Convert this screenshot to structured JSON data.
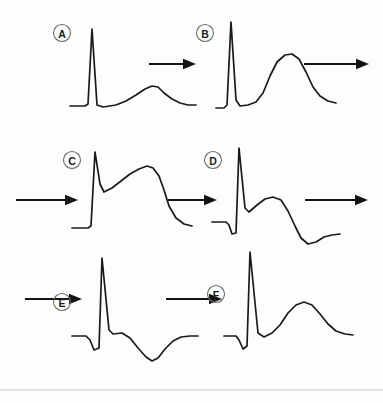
{
  "figure": {
    "background_color": "#fdfdfd",
    "stroke_color": "#1a1a1a",
    "label_circle_color": "#6b6b6b",
    "rule_color": "#c9c9c9"
  },
  "panels": [
    {
      "id": "A",
      "label": "A",
      "description": "Normal ECG complex: flat baseline, tall narrow R wave, low broad upright T wave",
      "label_pos": {
        "x": 62,
        "y": 33
      },
      "path": "M 70 106 L 85 106 L 88 104 L 92 29 L 97 105 L 103 107 L 116 105 L 126 101 L 136 95 L 145 89 L 152 86 L 158 87 L 164 93 L 172 99 L 180 103 L 188 105 L 196 105"
    },
    {
      "id": "B",
      "label": "B",
      "description": "Hyperacute T waves: tall broad peaked T wave appears",
      "label_pos": {
        "x": 205,
        "y": 33
      },
      "path": "M 216 108 L 224 108 L 227 105 L 231 22 L 236 100 L 240 106 L 248 105 L 256 102 L 263 93 L 270 76 L 277 62 L 285 55 L 292 54 L 299 59 L 306 72 L 313 87 L 320 96 L 328 101 L 336 103"
    },
    {
      "id": "C",
      "label": "C",
      "description": "Marked ST elevation merging with T wave, tombstone morphology",
      "label_pos": {
        "x": 72,
        "y": 160
      },
      "path": "M 72 228 L 88 228 L 91 226 L 95 152 L 100 184 L 104 192 L 112 188 L 121 181 L 130 174 L 139 169 L 147 166 L 153 168 L 159 176 L 164 190 L 169 206 L 176 218 L 184 224 L 192 226"
    },
    {
      "id": "D",
      "label": "D",
      "description": "Pathological Q wave develops, ST elevation persists, T wave begins to invert",
      "label_pos": {
        "x": 213,
        "y": 160
      },
      "path": "M 212 222 L 226 222 L 229 225 L 232 234 L 236 233 L 239 148 L 245 208 L 249 212 L 257 205 L 265 199 L 273 197 L 281 200 L 288 211 L 295 226 L 301 238 L 308 244 L 316 242 L 324 237 L 332 235 L 340 234"
    },
    {
      "id": "E",
      "label": "E",
      "description": "ST segment returns towards baseline with deep symmetrical T wave inversion",
      "label_pos": {
        "x": 62,
        "y": 302
      },
      "path": "M 72 336 L 86 336 L 90 340 L 94 350 L 99 348 L 102 258 L 109 330 L 113 334 L 122 333 L 130 338 L 138 348 L 146 357 L 152 361 L 158 358 L 165 349 L 173 341 L 181 337 L 190 336 L 198 336"
    },
    {
      "id": "F",
      "label": "F",
      "description": "Q wave persists, T wave returns upright as changes resolve",
      "label_pos": {
        "x": 216,
        "y": 294
      },
      "path": "M 224 336 L 236 336 L 239 340 L 243 349 L 247 346 L 250 252 L 258 333 L 264 337 L 272 333 L 280 325 L 288 313 L 296 305 L 304 302 L 312 305 L 320 314 L 328 324 L 336 331 L 345 334 L 353 335"
    }
  ],
  "arrows": [
    {
      "name": "arrow-a-to-b",
      "x1": 149,
      "y1": 64,
      "x2": 196,
      "y2": 64
    },
    {
      "name": "arrow-b-to-c",
      "x1": 304,
      "y1": 64,
      "x2": 369,
      "y2": 64
    },
    {
      "name": "arrow-into-c",
      "x1": 16,
      "y1": 200,
      "x2": 78,
      "y2": 200
    },
    {
      "name": "arrow-c-to-d",
      "x1": 168,
      "y1": 200,
      "x2": 217,
      "y2": 200
    },
    {
      "name": "arrow-d-to-e",
      "x1": 305,
      "y1": 200,
      "x2": 368,
      "y2": 200
    },
    {
      "name": "arrow-into-e",
      "x1": 25,
      "y1": 299,
      "x2": 82,
      "y2": 299
    },
    {
      "name": "arrow-e-to-f",
      "x1": 166,
      "y1": 299,
      "x2": 222,
      "y2": 299
    }
  ],
  "rule": {
    "x1": 0,
    "y1": 390,
    "x2": 383,
    "y2": 390
  }
}
